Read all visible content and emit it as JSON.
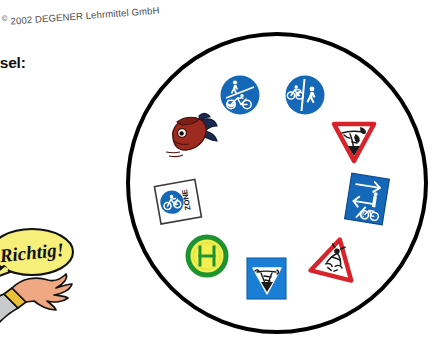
{
  "page": {
    "background_color": "#ffffff",
    "width": 438,
    "height": 358
  },
  "copyright": {
    "mark": "©",
    "text": " 2002 DEGENER Lehrmittel GmbH"
  },
  "text_column": {
    "heading": "hen-Kreisel:",
    "line1": "u das",
    "line2": "eint",
    "line3": "e"
  },
  "cartoon": {
    "name": "cartoon-character-pointing",
    "speech_bubble_text": "Richtig!",
    "bubble_fill": "#f6ef7a",
    "bubble_stroke": "#111111",
    "hat_color": "#b51b1b",
    "sleeve_color": "#c9cacc",
    "cuff_color": "#e9c23a",
    "skin_color": "#f0a882"
  },
  "ring": {
    "name": "traffic-sign-circle",
    "stroke_color": "#000000",
    "fill_color": "#ffffff",
    "stroke_width": 4,
    "diameter": 302
  },
  "signs": [
    {
      "id": "sign-bike-ped-diagonal",
      "label": "Gemeinsamer Fuß- und Radweg getrennt (diagonal)",
      "shape": "circle",
      "fill": "#1567b8",
      "symbol_color": "#ffffff",
      "position": {
        "x": 219,
        "y": 74
      },
      "rotation": 0
    },
    {
      "id": "sign-bike-ped-vertical",
      "label": "Getrennter Rad- und Gehweg (vertikal)",
      "shape": "circle",
      "fill": "#1567b8",
      "symbol_color": "#ffffff",
      "position": {
        "x": 284,
        "y": 74
      },
      "rotation": 0
    },
    {
      "id": "decoy-fish",
      "label": "Fisch (kein Verkehrszeichen)",
      "shape": "illustration",
      "fill": "#9e2b20",
      "symbol_color": "#1b2a52",
      "position": {
        "x": 163,
        "y": 108
      },
      "rotation": 0
    },
    {
      "id": "sign-yield-scribble",
      "label": "Vorfahrt achten (mit Kritzelei)",
      "shape": "triangle-down",
      "fill": "#ffffff",
      "border": "#d8232a",
      "symbol_color": "#1a1a1a",
      "position": {
        "x": 330,
        "y": 118
      },
      "rotation": 0
    },
    {
      "id": "sign-bicycle-zone",
      "label": "Fahrradzone",
      "shape": "square",
      "fill": "#ffffff",
      "border": "#3a3a3a",
      "symbol_color": "#1567b8",
      "badge_text": "ZONE",
      "position": {
        "x": 155,
        "y": 179
      },
      "rotation": -10
    },
    {
      "id": "sign-bike-route-end",
      "label": "Radwegweiser Ende",
      "shape": "rectangle",
      "fill": "#1567b8",
      "symbol_color": "#ffffff",
      "badge_text": "E",
      "position": {
        "x": 345,
        "y": 173
      },
      "rotation": 9
    },
    {
      "id": "sign-bus-stop-h",
      "label": "Haltestelle (H)",
      "shape": "circle",
      "fill": "#f2ef4f",
      "border": "#1e9430",
      "symbol_color": "#1e9430",
      "badge_text": "H",
      "position": {
        "x": 185,
        "y": 234
      },
      "rotation": 0
    },
    {
      "id": "sign-blue-square-triangle",
      "label": "Blaues Quadrat mit weißem Dreieck",
      "shape": "square",
      "fill": "#1a7fd4",
      "symbol_color": "#ffffff",
      "position": {
        "x": 244,
        "y": 254
      },
      "rotation": 0
    },
    {
      "id": "sign-warning-triangle",
      "label": "Gefahrstelle (Warndreieck)",
      "shape": "triangle-up",
      "fill": "#ffffff",
      "border": "#d8232a",
      "symbol_color": "#1a1a1a",
      "position": {
        "x": 310,
        "y": 234
      },
      "rotation": 14
    }
  ]
}
